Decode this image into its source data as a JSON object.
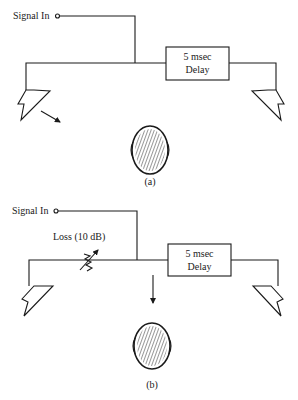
{
  "panels": [
    {
      "id": "a",
      "caption": "(a)",
      "signal_label": "Signal In",
      "delay_line1": "5 msec",
      "delay_line2": "Delay",
      "arrow_direction": "toward-left-speaker"
    },
    {
      "id": "b",
      "caption": "(b)",
      "signal_label": "Signal In",
      "loss_label": "Loss (10 dB)",
      "delay_line1": "5 msec",
      "delay_line2": "Delay",
      "arrow_direction": "straight-ahead"
    }
  ],
  "icons": {
    "speaker": "loudspeaker-icon",
    "listener": "listener-head-icon",
    "attenuator": "variable-resistor-icon",
    "input": "input-terminal-icon"
  },
  "colors": {
    "ink": "#1a1a1a",
    "background": "#ffffff"
  }
}
